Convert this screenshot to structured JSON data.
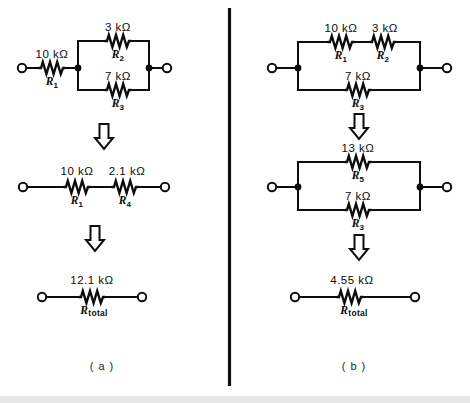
{
  "figure": {
    "panels": [
      {
        "id": "panel-a",
        "caption": "( a )",
        "steps": [
          {
            "id": "a-step-1",
            "type": "series-parallel",
            "resistors": [
              {
                "ref": "R",
                "sub": "1",
                "value": "10 kΩ",
                "position": "series-left"
              },
              {
                "ref": "R",
                "sub": "2",
                "value": "3 kΩ",
                "position": "parallel-top"
              },
              {
                "ref": "R",
                "sub": "3",
                "value": "7 kΩ",
                "position": "parallel-bottom"
              }
            ]
          },
          {
            "id": "a-step-2",
            "type": "series",
            "resistors": [
              {
                "ref": "R",
                "sub": "1",
                "value": "10 kΩ",
                "position": "series-left"
              },
              {
                "ref": "R",
                "sub": "4",
                "value": "2.1 kΩ",
                "position": "series-right"
              }
            ]
          },
          {
            "id": "a-step-3",
            "type": "single",
            "resistors": [
              {
                "ref": "R",
                "sub": "total",
                "value": "12.1 kΩ",
                "position": "single"
              }
            ]
          }
        ]
      },
      {
        "id": "panel-b",
        "caption": "( b )",
        "steps": [
          {
            "id": "b-step-1",
            "type": "parallel-with-series-branch",
            "resistors": [
              {
                "ref": "R",
                "sub": "1",
                "value": "10 kΩ",
                "position": "branch-top-left"
              },
              {
                "ref": "R",
                "sub": "2",
                "value": "3 kΩ",
                "position": "branch-top-right"
              },
              {
                "ref": "R",
                "sub": "3",
                "value": "7 kΩ",
                "position": "branch-bottom"
              }
            ]
          },
          {
            "id": "b-step-2",
            "type": "parallel",
            "resistors": [
              {
                "ref": "R",
                "sub": "5",
                "value": "13 kΩ",
                "position": "parallel-top"
              },
              {
                "ref": "R",
                "sub": "3",
                "value": "7 kΩ",
                "position": "parallel-bottom"
              }
            ]
          },
          {
            "id": "b-step-3",
            "type": "single",
            "resistors": [
              {
                "ref": "R",
                "sub": "total",
                "value": "4.55 kΩ",
                "position": "single"
              }
            ]
          }
        ]
      }
    ],
    "arrows": [
      {
        "id": "arrow-a-1",
        "direction": "down"
      },
      {
        "id": "arrow-a-2",
        "direction": "down"
      },
      {
        "id": "arrow-b-1",
        "direction": "down"
      },
      {
        "id": "arrow-b-2",
        "direction": "down"
      }
    ],
    "colors": {
      "ink": "#0d0d0d",
      "background": "#ffffff",
      "divider": "#111111"
    }
  },
  "labels": {
    "a1_r1_val": "10 kΩ",
    "a1_r2_val": "3 kΩ",
    "a1_r3_val": "7 kΩ",
    "a2_r1_val": "10 kΩ",
    "a2_r4_val": "2.1 kΩ",
    "a3_rt_val": "12.1 kΩ",
    "b1_r1_val": "10 kΩ",
    "b1_r2_val": "3 kΩ",
    "b1_r3_val": "7 kΩ",
    "b2_r5_val": "13 kΩ",
    "b2_r3_val": "7 kΩ",
    "b3_rt_val": "4.55 kΩ",
    "caption_a": "( a )",
    "caption_b": "( b )"
  }
}
